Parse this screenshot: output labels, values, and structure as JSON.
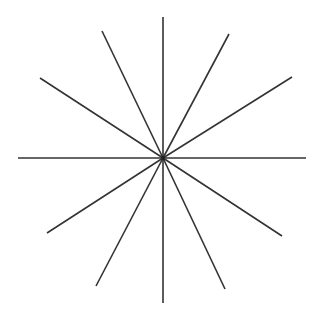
{
  "diagram": {
    "title": "",
    "type": "radial-star",
    "canvas": {
      "width": 319,
      "height": 310,
      "background": "#ffffff"
    },
    "stroke": {
      "color": "#333333",
      "width": 1.6
    },
    "center": {
      "x": 163,
      "y": 158
    },
    "rays": [
      {
        "name": "ray-up",
        "x": 163,
        "y": 17
      },
      {
        "name": "ray-upper-right-steep",
        "x": 229,
        "y": 34
      },
      {
        "name": "ray-upper-right-shallow",
        "x": 292,
        "y": 77
      },
      {
        "name": "ray-right",
        "x": 306,
        "y": 158
      },
      {
        "name": "ray-lower-right-shallow",
        "x": 282,
        "y": 236
      },
      {
        "name": "ray-lower-right-steep",
        "x": 225,
        "y": 289
      },
      {
        "name": "ray-down",
        "x": 163,
        "y": 303
      },
      {
        "name": "ray-lower-left-steep",
        "x": 96,
        "y": 286
      },
      {
        "name": "ray-lower-left-shallow",
        "x": 47,
        "y": 233
      },
      {
        "name": "ray-left",
        "x": 18,
        "y": 158
      },
      {
        "name": "ray-upper-left-shallow",
        "x": 40,
        "y": 78
      },
      {
        "name": "ray-upper-left-steep",
        "x": 102,
        "y": 31
      }
    ]
  }
}
